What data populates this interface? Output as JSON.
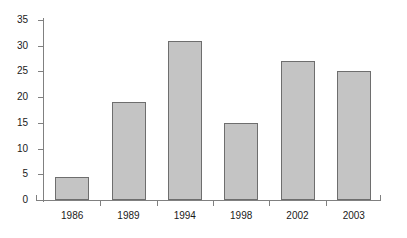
{
  "chart_data": {
    "type": "bar",
    "title": "",
    "subtitle": "",
    "xlabel": "",
    "ylabel": "",
    "categories": [
      "1986",
      "1989",
      "1994",
      "1998",
      "2002",
      "2003"
    ],
    "values": [
      4.5,
      19,
      31,
      15,
      27,
      25
    ],
    "series": [
      {
        "name": "",
        "values": [
          4.5,
          19,
          31,
          15,
          27,
          25
        ]
      }
    ],
    "ylim": [
      0,
      35
    ],
    "ytick_values": [
      0,
      5,
      10,
      15,
      20,
      25,
      30,
      35
    ],
    "ytick_labels": [
      "0",
      "5",
      "10",
      "15",
      "20",
      "25",
      "30",
      "35"
    ],
    "grid": false,
    "legend": null,
    "legend_position": "none",
    "annotations": [],
    "colors": {
      "bar_fill": "#c4c4c4",
      "bar_border": "#6e6e6e",
      "axis": "#808080",
      "text": "#1a1a1a",
      "background": "#ffffff"
    }
  }
}
